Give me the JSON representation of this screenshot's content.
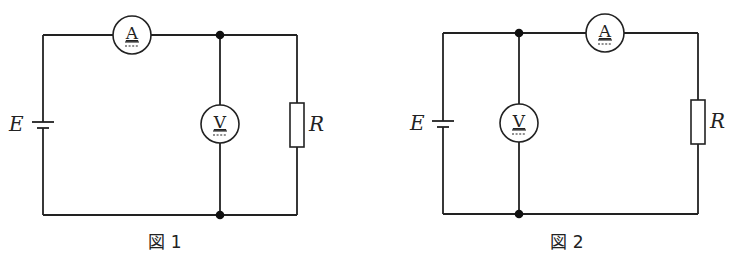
{
  "figures": [
    {
      "caption": "図 1",
      "battery_label": "E",
      "resistor_label": "R",
      "ammeter_label": "A",
      "voltmeter_label": "V",
      "configuration": "ammeter in series before junction; voltmeter in parallel directly across resistor"
    },
    {
      "caption": "図 2",
      "battery_label": "E",
      "resistor_label": "R",
      "ammeter_label": "A",
      "voltmeter_label": "V",
      "configuration": "voltmeter in parallel across source; ammeter in series with resistor after junction"
    }
  ]
}
